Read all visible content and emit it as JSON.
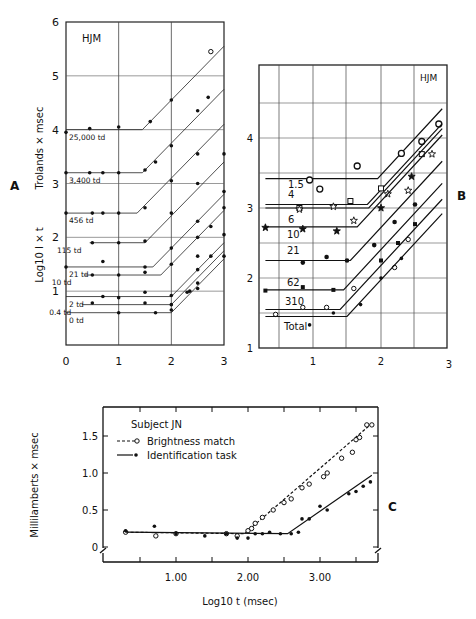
{
  "chart_data": [
    {
      "id": "A",
      "panel_label": "A",
      "type": "line",
      "title": "HJM",
      "xlabel": "",
      "ylabel": "Log10 I × t",
      "ylabel_top": "Trolands × msec",
      "xlim": [
        0,
        3
      ],
      "ylim": [
        0,
        6
      ],
      "xticks": [
        "0",
        "1",
        "2",
        "3"
      ],
      "yticks": [
        "1",
        "2",
        "3",
        "4",
        "5",
        "6"
      ],
      "grid": true,
      "series": [
        {
          "name": "25,000 td",
          "plateau": 4.0,
          "knee": 1.45,
          "points": [
            [
              0.0,
              3.95
            ],
            [
              0.45,
              4.02
            ],
            [
              1.0,
              4.05
            ],
            [
              1.6,
              4.15
            ],
            [
              2.0,
              4.55
            ],
            [
              2.5,
              4.35
            ],
            [
              2.7,
              4.6
            ],
            [
              2.75,
              5.45
            ]
          ]
        },
        {
          "name": "3,400 td",
          "plateau": 3.2,
          "knee": 1.45,
          "points": [
            [
              0.0,
              3.2
            ],
            [
              0.45,
              3.2
            ],
            [
              0.7,
              3.2
            ],
            [
              1.0,
              3.2
            ],
            [
              1.5,
              3.25
            ],
            [
              1.7,
              3.4
            ],
            [
              2.0,
              3.7
            ],
            [
              2.5,
              3.55
            ],
            [
              3.0,
              3.55
            ]
          ]
        },
        {
          "name": "456 td",
          "plateau": 2.45,
          "knee": 1.35,
          "points": [
            [
              0.0,
              2.45
            ],
            [
              0.5,
              2.45
            ],
            [
              0.7,
              2.45
            ],
            [
              1.0,
              2.45
            ],
            [
              1.5,
              2.55
            ],
            [
              2.0,
              3.05
            ],
            [
              2.5,
              3.0
            ],
            [
              3.0,
              2.85
            ]
          ]
        },
        {
          "name": "115 td",
          "plateau": 1.9,
          "knee": 1.5,
          "points": [
            [
              0.5,
              1.9
            ],
            [
              1.0,
              1.9
            ],
            [
              1.5,
              1.93
            ],
            [
              2.0,
              2.45
            ],
            [
              2.5,
              2.3
            ],
            [
              3.0,
              2.55
            ]
          ]
        },
        {
          "name": "21 td",
          "plateau": 1.45,
          "knee": 1.65,
          "points": [
            [
              0.0,
              1.45
            ],
            [
              0.7,
              1.55
            ],
            [
              1.5,
              1.45
            ],
            [
              2.0,
              1.8
            ],
            [
              2.5,
              2.0
            ],
            [
              2.75,
              2.2
            ]
          ]
        },
        {
          "name": "10 td",
          "plateau": 1.3,
          "knee": 1.8,
          "points": [
            [
              0.5,
              1.3
            ],
            [
              1.0,
              1.3
            ],
            [
              1.5,
              1.35
            ],
            [
              2.0,
              1.5
            ],
            [
              2.5,
              1.65
            ],
            [
              3.0,
              2.05
            ]
          ]
        },
        {
          "name": "2 td",
          "plateau": 0.9,
          "knee": 2.0,
          "points": [
            [
              0.7,
              0.9
            ],
            [
              1.0,
              0.88
            ],
            [
              1.5,
              0.98
            ],
            [
              2.0,
              0.92
            ],
            [
              2.35,
              1.0
            ],
            [
              2.5,
              1.4
            ],
            [
              2.75,
              1.65
            ],
            [
              3.0,
              1.65
            ]
          ]
        },
        {
          "name": "0.4 td",
          "plateau": 0.75,
          "knee": 2.0,
          "points": [
            [
              0.5,
              0.78
            ],
            [
              1.5,
              0.78
            ],
            [
              2.0,
              0.75
            ],
            [
              2.3,
              0.98
            ],
            [
              2.5,
              1.15
            ]
          ]
        },
        {
          "name": "0 td",
          "plateau": 0.6,
          "knee": 2.0,
          "points": [
            [
              1.0,
              0.6
            ],
            [
              1.7,
              0.6
            ],
            [
              2.0,
              0.65
            ],
            [
              2.5,
              1.05
            ]
          ]
        }
      ]
    },
    {
      "id": "B",
      "panel_label": "B",
      "type": "line",
      "title": "HJM",
      "xlabel": "",
      "ylabel": "",
      "xlim": [
        0,
        3
      ],
      "ylim": [
        1,
        4.7
      ],
      "xticks": [
        "1",
        "2",
        "3"
      ],
      "yticks": [
        "1",
        "2",
        "3",
        "4"
      ],
      "grid": true,
      "series": [
        {
          "name": "1.5",
          "marker": "open-circle",
          "plateau": 3.42,
          "knee": 1.95,
          "points": [
            [
              0.95,
              3.4
            ],
            [
              1.1,
              3.27
            ],
            [
              1.65,
              3.6
            ],
            [
              2.3,
              3.78
            ],
            [
              2.6,
              3.95
            ],
            [
              2.85,
              4.2
            ]
          ]
        },
        {
          "name": "4",
          "marker": "open-square",
          "plateau": 3.05,
          "knee": 1.8,
          "points": [
            [
              0.8,
              3.0
            ],
            [
              1.55,
              3.1
            ],
            [
              2.0,
              3.28
            ],
            [
              2.6,
              3.77
            ]
          ]
        },
        {
          "name": "6",
          "marker": "open-star",
          "plateau": 3.0,
          "knee": 1.82,
          "points": [
            [
              0.8,
              2.98
            ],
            [
              1.3,
              3.02
            ],
            [
              1.6,
              2.82
            ],
            [
              2.1,
              3.2
            ],
            [
              2.4,
              3.25
            ],
            [
              2.75,
              3.77
            ]
          ]
        },
        {
          "name": "10",
          "marker": "filled-star",
          "plateau": 2.73,
          "knee": 1.65,
          "points": [
            [
              0.3,
              2.72
            ],
            [
              0.85,
              2.7
            ],
            [
              1.35,
              2.67
            ],
            [
              2.0,
              3.0
            ],
            [
              2.45,
              3.45
            ]
          ]
        },
        {
          "name": "21",
          "marker": "filled-circle",
          "plateau": 2.25,
          "knee": 1.55,
          "points": [
            [
              0.85,
              2.22
            ],
            [
              1.2,
              2.3
            ],
            [
              1.5,
              2.25
            ],
            [
              1.9,
              2.47
            ],
            [
              2.2,
              2.8
            ],
            [
              2.5,
              3.05
            ]
          ]
        },
        {
          "name": "62",
          "marker": "filled-square",
          "plateau": 1.83,
          "knee": 1.45,
          "points": [
            [
              0.3,
              1.82
            ],
            [
              0.85,
              1.87
            ],
            [
              1.3,
              1.83
            ],
            [
              2.0,
              2.25
            ],
            [
              2.25,
              2.5
            ],
            [
              2.5,
              2.77
            ]
          ]
        },
        {
          "name": "310",
          "marker": "open-circle-small",
          "plateau": 1.55,
          "knee": 1.4,
          "points": [
            [
              0.45,
              1.48
            ],
            [
              0.85,
              1.58
            ],
            [
              1.2,
              1.58
            ],
            [
              1.6,
              1.85
            ],
            [
              2.2,
              2.15
            ],
            [
              2.4,
              2.55
            ]
          ]
        },
        {
          "name": "Total",
          "marker": "filled-dot",
          "plateau": 1.45,
          "knee": 1.5,
          "points": [
            [
              0.95,
              1.33
            ],
            [
              1.3,
              1.5
            ],
            [
              1.7,
              1.62
            ],
            [
              2.0,
              2.0
            ],
            [
              2.3,
              2.28
            ]
          ]
        }
      ]
    },
    {
      "id": "C",
      "panel_label": "C",
      "type": "line",
      "title": "Subject JN",
      "xlabel": "Log10 t (msec)",
      "ylabel": "Millilamberts × msec",
      "xlim": [
        0,
        3.75
      ],
      "ylim": [
        -0.2,
        1.9
      ],
      "xticks": [
        "1.00",
        "2.00",
        "3.00"
      ],
      "yticks": [
        "0",
        "0.5",
        "1.0",
        "1.5"
      ],
      "grid": false,
      "legend": {
        "position": "upper-left",
        "entries": [
          "Brightness match",
          "Identification task"
        ]
      },
      "series": [
        {
          "name": "Brightness match",
          "style": "dashed",
          "marker": "open-circle",
          "points": [
            [
              0.3,
              0.2
            ],
            [
              0.72,
              0.15
            ],
            [
              1.0,
              0.18
            ],
            [
              1.7,
              0.18
            ],
            [
              1.85,
              0.15
            ],
            [
              2.0,
              0.22
            ],
            [
              2.05,
              0.25
            ],
            [
              2.1,
              0.32
            ],
            [
              2.2,
              0.4
            ],
            [
              2.35,
              0.5
            ],
            [
              2.5,
              0.6
            ],
            [
              2.6,
              0.65
            ],
            [
              2.75,
              0.8
            ],
            [
              2.85,
              0.85
            ],
            [
              3.05,
              0.95
            ],
            [
              3.1,
              1.0
            ],
            [
              3.3,
              1.2
            ],
            [
              3.45,
              1.28
            ],
            [
              3.5,
              1.45
            ],
            [
              3.55,
              1.48
            ],
            [
              3.65,
              1.65
            ],
            [
              3.72,
              1.65
            ]
          ],
          "fit": [
            [
              0.3,
              0.2
            ],
            [
              1.95,
              0.18
            ],
            [
              3.72,
              1.67
            ]
          ]
        },
        {
          "name": "Identification task",
          "style": "solid",
          "marker": "filled-circle",
          "points": [
            [
              0.3,
              0.22
            ],
            [
              0.7,
              0.28
            ],
            [
              1.0,
              0.18
            ],
            [
              1.4,
              0.15
            ],
            [
              1.7,
              0.18
            ],
            [
              1.85,
              0.12
            ],
            [
              2.0,
              0.12
            ],
            [
              2.1,
              0.18
            ],
            [
              2.2,
              0.18
            ],
            [
              2.3,
              0.2
            ],
            [
              2.45,
              0.18
            ],
            [
              2.6,
              0.18
            ],
            [
              2.7,
              0.2
            ],
            [
              2.75,
              0.38
            ],
            [
              2.85,
              0.38
            ],
            [
              3.0,
              0.55
            ],
            [
              3.1,
              0.5
            ],
            [
              3.4,
              0.72
            ],
            [
              3.5,
              0.75
            ],
            [
              3.6,
              0.82
            ],
            [
              3.7,
              0.88
            ]
          ],
          "fit": [
            [
              0.3,
              0.2
            ],
            [
              2.55,
              0.18
            ],
            [
              3.72,
              0.97
            ]
          ]
        }
      ]
    }
  ]
}
